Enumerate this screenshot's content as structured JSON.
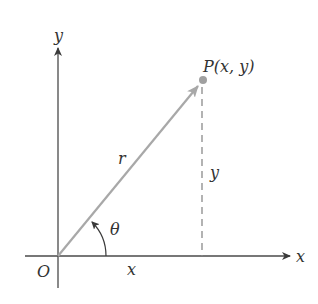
{
  "diagram": {
    "type": "polar-cartesian-relationship",
    "labels": {
      "y_axis": "y",
      "x_axis": "x",
      "origin": "O",
      "point": "P(x, y)",
      "radius": "r",
      "angle": "θ",
      "x_length": "x",
      "y_length": "y"
    },
    "colors": {
      "axis": "#4a4a4a",
      "vector": "#a8a8a8",
      "point": "#a0a0a0",
      "dashed": "#8a8a8a",
      "text": "#333333"
    }
  }
}
